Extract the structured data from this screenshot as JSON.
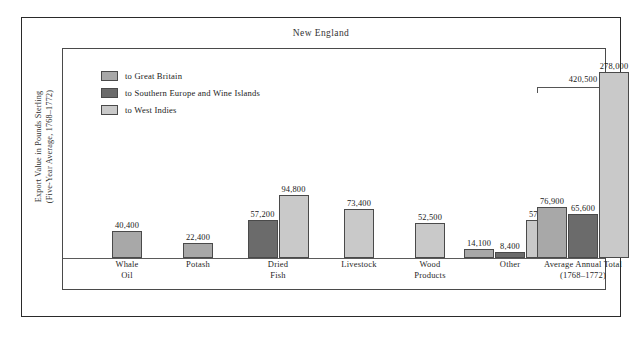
{
  "figure": {
    "title": "New England",
    "ylabel_line1": "Export Value in Pounds Sterling",
    "ylabel_line2": "(Five-Year Average, 1768–1772)"
  },
  "legend": {
    "items": [
      {
        "label": "to Great Britain",
        "color": "#a8a8a8",
        "key": "great-britain"
      },
      {
        "label": "to Southern Europe and Wine Islands",
        "color": "#6b6b6b",
        "key": "southern-europe"
      },
      {
        "label": "to West Indies",
        "color": "#c9c9c9",
        "key": "west-indies"
      }
    ]
  },
  "bracket": {
    "label": "420,500"
  },
  "chart_data": {
    "type": "bar",
    "title": "New England",
    "xlabel": "",
    "ylabel": "Export Value in Pounds Sterling (Five-Year Average, 1768–1772)",
    "ylim": [
      0,
      278000
    ],
    "grid": false,
    "legend_position": "top-left",
    "categories": [
      "Whale Oil",
      "Potash",
      "Dried Fish",
      "Livestock",
      "Wood Products",
      "Other",
      "Average Annual Total (1768–1772)"
    ],
    "series": [
      {
        "name": "to Great Britain",
        "color": "#a8a8a8",
        "values": [
          40400,
          22400,
          null,
          null,
          null,
          14100,
          76900
        ]
      },
      {
        "name": "to Southern Europe and Wine Islands",
        "color": "#6b6b6b",
        "values": [
          null,
          null,
          57200,
          null,
          null,
          8400,
          65600
        ]
      },
      {
        "name": "to West Indies",
        "color": "#c9c9c9",
        "values": [
          null,
          null,
          94800,
          73400,
          52500,
          57300,
          278000
        ]
      }
    ],
    "annotations": [
      {
        "text": "420,500",
        "note": "bracket spanning Average Annual Total group"
      }
    ]
  },
  "groups": [
    {
      "name": "whale-oil",
      "label_line1": "Whale",
      "label_line2": "Oil",
      "bars": [
        {
          "series": "to Great Britain",
          "value": 40400,
          "value_label": "40,400",
          "color": "#a8a8a8"
        }
      ]
    },
    {
      "name": "potash",
      "label_line1": "Potash",
      "label_line2": "",
      "bars": [
        {
          "series": "to Great Britain",
          "value": 22400,
          "value_label": "22,400",
          "color": "#a8a8a8"
        }
      ]
    },
    {
      "name": "dried-fish",
      "label_line1": "Dried",
      "label_line2": "Fish",
      "bars": [
        {
          "series": "to Southern Europe and Wine Islands",
          "value": 57200,
          "value_label": "57,200",
          "color": "#6b6b6b"
        },
        {
          "series": "to West Indies",
          "value": 94800,
          "value_label": "94,800",
          "color": "#c9c9c9"
        }
      ]
    },
    {
      "name": "livestock",
      "label_line1": "Livestock",
      "label_line2": "",
      "bars": [
        {
          "series": "to West Indies",
          "value": 73400,
          "value_label": "73,400",
          "color": "#c9c9c9"
        }
      ]
    },
    {
      "name": "wood-products",
      "label_line1": "Wood",
      "label_line2": "Products",
      "bars": [
        {
          "series": "to West Indies",
          "value": 52500,
          "value_label": "52,500",
          "color": "#c9c9c9"
        }
      ]
    },
    {
      "name": "other",
      "label_line1": "Other",
      "label_line2": "",
      "bars": [
        {
          "series": "to Great Britain",
          "value": 14100,
          "value_label": "14,100",
          "color": "#a8a8a8"
        },
        {
          "series": "to Southern Europe and Wine Islands",
          "value": 8400,
          "value_label": "8,400",
          "color": "#6b6b6b"
        },
        {
          "series": "to West Indies",
          "value": 57300,
          "value_label": "57,300",
          "color": "#c9c9c9"
        }
      ]
    },
    {
      "name": "average-annual-total",
      "label_line1": "Average Annual Total",
      "label_line2": "(1768–1772)",
      "bars": [
        {
          "series": "to Great Britain",
          "value": 76900,
          "value_label": "76,900",
          "color": "#a8a8a8"
        },
        {
          "series": "to Southern Europe and Wine Islands",
          "value": 65600,
          "value_label": "65,600",
          "color": "#6b6b6b"
        },
        {
          "series": "to West Indies",
          "value": 278000,
          "value_label": "278,000",
          "color": "#c9c9c9"
        }
      ]
    }
  ]
}
